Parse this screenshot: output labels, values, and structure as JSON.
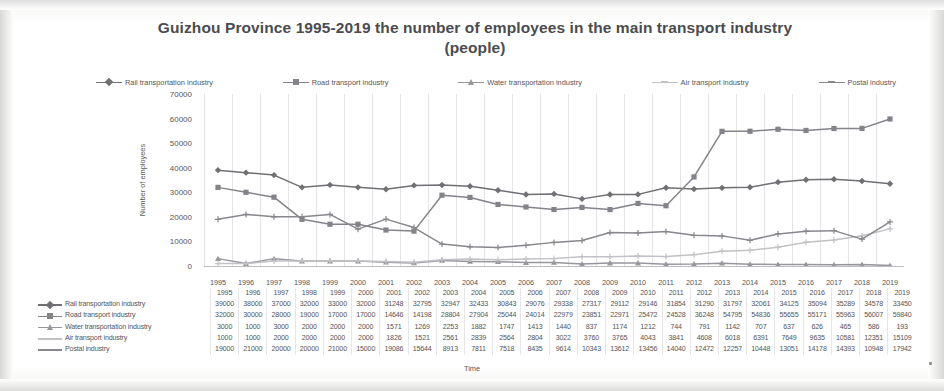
{
  "chart_data": {
    "type": "line",
    "title": "Guizhou Province 1995-2019 the number of employees in the main transport industry (people)",
    "xlabel": "Time",
    "ylabel": "Number of employees",
    "ylim": [
      0,
      70000
    ],
    "yticks": [
      0,
      10000,
      20000,
      30000,
      40000,
      50000,
      60000,
      70000
    ],
    "grid": "vertical",
    "legend_position": "top",
    "categories": [
      "1995",
      "1996",
      "1997",
      "1998",
      "1999",
      "2000",
      "2001",
      "2002",
      "2003",
      "2004",
      "2005",
      "2006",
      "2007",
      "2008",
      "2009",
      "2010",
      "2011",
      "2012",
      "2013",
      "2014",
      "2015",
      "2016",
      "2017",
      "2018",
      "2019"
    ],
    "series": [
      {
        "name": "Rail transportation industry",
        "color": "#6f6f74",
        "marker": "diamond",
        "values": [
          39000,
          38000,
          37000,
          32000,
          33000,
          32000,
          31248,
          32795,
          32947,
          32433,
          30843,
          29076,
          29338,
          27317,
          29112,
          29146,
          31854,
          31290,
          31797,
          32061,
          34125,
          35094,
          35289,
          34578,
          33450
        ]
      },
      {
        "name": "Road transport industry",
        "color": "#83838a",
        "marker": "square",
        "values": [
          32000,
          30000,
          28000,
          19000,
          17000,
          17000,
          14646,
          14198,
          28804,
          27904,
          25044,
          24014,
          22979,
          23851,
          22971,
          25472,
          24528,
          36248,
          54795,
          54836,
          55655,
          55171,
          55963,
          56007,
          59840
        ]
      },
      {
        "name": "Water transportation industry",
        "color": "#96969c",
        "marker": "triangle",
        "values": [
          3000,
          1000,
          3000,
          2000,
          2000,
          2000,
          1571,
          1269,
          2253,
          1882,
          1747,
          1413,
          1440,
          837,
          1174,
          1212,
          744,
          791,
          1142,
          707,
          637,
          626,
          465,
          586,
          193
        ]
      },
      {
        "name": "Air transport industry",
        "color": "#c2c2c6",
        "marker": "cross",
        "values": [
          1000,
          1000,
          2000,
          2000,
          2000,
          2000,
          1826,
          1521,
          2561,
          2839,
          2564,
          2804,
          3022,
          3760,
          3765,
          4043,
          3841,
          4608,
          6018,
          6391,
          7649,
          9635,
          10581,
          12351,
          15109
        ]
      },
      {
        "name": "Postal industry",
        "color": "#87878d",
        "marker": "plus",
        "values": [
          19000,
          21000,
          20000,
          20000,
          21000,
          15000,
          19086,
          15644,
          8913,
          7811,
          7518,
          8435,
          9614,
          10343,
          13612,
          13456,
          14040,
          12472,
          12257,
          10448,
          13051,
          14178,
          14393,
          10948,
          17942
        ]
      }
    ]
  }
}
